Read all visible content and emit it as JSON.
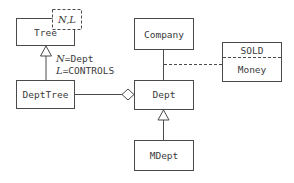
{
  "diagram": {
    "type": "uml-class-diagram",
    "classes": {
      "tree": {
        "name": "Tree",
        "type_params": "N,L"
      },
      "dept_tree": {
        "name": "DeptTree"
      },
      "company": {
        "name": "Company"
      },
      "dept": {
        "name": "Dept"
      },
      "mdept": {
        "name": "MDept"
      },
      "association_class": {
        "name": "Money",
        "stereotype_label": "SOLD"
      }
    },
    "bindings": {
      "n_param": "N",
      "n_value": "=Dept",
      "l_param": "L",
      "l_value": "=CONTROLS"
    },
    "relationships": [
      {
        "from": "DeptTree",
        "to": "Tree",
        "kind": "generalization"
      },
      {
        "from": "DeptTree",
        "to": "Dept",
        "kind": "aggregation"
      },
      {
        "from": "Company",
        "to": "Dept",
        "kind": "association"
      },
      {
        "from": "SOLD/Money",
        "to": "Company-Dept association",
        "kind": "association-class"
      },
      {
        "from": "MDept",
        "to": "Dept",
        "kind": "generalization"
      }
    ]
  }
}
